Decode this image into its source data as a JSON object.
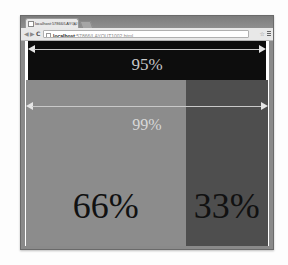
{
  "browser": {
    "tab_title": "localhost:57866/LAYOU",
    "tab_close": "×",
    "back_glyph": "◀",
    "forward_glyph": "▶",
    "reload_glyph": "C",
    "url_host": "localhost",
    "url_path": ":57866/LAYOUT1002.html",
    "star_glyph": "☆"
  },
  "page": {
    "band95": {
      "label": "95%",
      "background": "#0d0d0d"
    },
    "band99": {
      "label": "99%",
      "columns": [
        {
          "label": "66%",
          "background": "#8c8c8c"
        },
        {
          "label": "33%",
          "background": "#4e4e4e"
        }
      ]
    },
    "arrow_color": "#e6e6e6"
  }
}
